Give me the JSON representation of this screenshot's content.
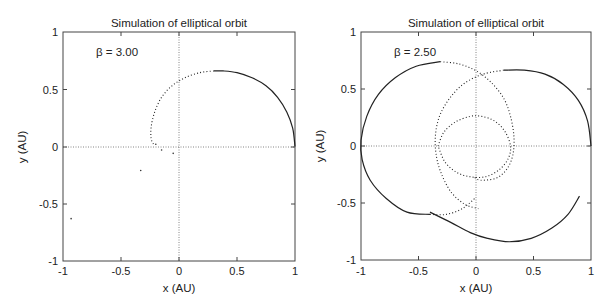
{
  "chart_data": [
    {
      "type": "line",
      "title": "Simulation of elliptical orbit",
      "xlabel": "x (AU)",
      "ylabel": "y (AU)",
      "xlim": [
        -1,
        1
      ],
      "ylim": [
        -1,
        1
      ],
      "xticks": [
        "-1",
        "-0.5",
        "0",
        "0.5",
        "1"
      ],
      "yticks": [
        "1",
        "0.5",
        "0",
        "-0.5",
        "-1"
      ],
      "grid": false,
      "zero_lines": true,
      "annotation": "β = 3.00",
      "series": [
        {
          "name": "orbit-solid",
          "style": "solid",
          "points": [
            [
              1.0,
              0.0
            ],
            [
              0.98,
              0.16
            ],
            [
              0.93,
              0.3
            ],
            [
              0.85,
              0.43
            ],
            [
              0.75,
              0.53
            ],
            [
              0.63,
              0.6
            ],
            [
              0.5,
              0.645
            ],
            [
              0.38,
              0.66
            ],
            [
              0.3,
              0.66
            ]
          ]
        },
        {
          "name": "orbit-dotted",
          "style": "dotted",
          "points": [
            [
              0.3,
              0.66
            ],
            [
              0.18,
              0.645
            ],
            [
              0.05,
              0.6
            ],
            [
              -0.06,
              0.53
            ],
            [
              -0.15,
              0.43
            ],
            [
              -0.21,
              0.3
            ],
            [
              -0.24,
              0.17
            ],
            [
              -0.24,
              0.07
            ],
            [
              -0.22,
              0.02
            ]
          ]
        },
        {
          "name": "scattered-points",
          "style": "points",
          "points": [
            [
              -0.2,
              0.02
            ],
            [
              -0.15,
              -0.03
            ],
            [
              -0.05,
              -0.06
            ],
            [
              -0.33,
              -0.21
            ],
            [
              -0.93,
              -0.63
            ]
          ]
        }
      ]
    },
    {
      "type": "line",
      "title": "Simulation of elliptical orbit",
      "xlabel": "x (AU)",
      "ylabel": "y (AU)",
      "xlim": [
        -1,
        1
      ],
      "ylim": [
        -1,
        1
      ],
      "xticks": [
        "-1",
        "-0.5",
        "0",
        "0.5",
        "1"
      ],
      "yticks": [
        "1",
        "0.5",
        "0",
        "-0.5",
        "-1"
      ],
      "grid": false,
      "zero_lines": true,
      "annotation": "β = 2.50",
      "series": [
        {
          "name": "orbit-1-solid",
          "style": "solid",
          "points": [
            [
              1.0,
              0.0
            ],
            [
              0.97,
              0.22
            ],
            [
              0.89,
              0.4
            ],
            [
              0.76,
              0.54
            ],
            [
              0.6,
              0.63
            ],
            [
              0.42,
              0.665
            ],
            [
              0.24,
              0.665
            ]
          ]
        },
        {
          "name": "orbit-1-dotted",
          "style": "dotted",
          "points": [
            [
              0.24,
              0.665
            ],
            [
              0.06,
              0.63
            ],
            [
              -0.1,
              0.55
            ],
            [
              -0.22,
              0.43
            ],
            [
              -0.31,
              0.28
            ],
            [
              -0.35,
              0.12
            ],
            [
              -0.35,
              -0.05
            ],
            [
              -0.31,
              -0.22
            ],
            [
              -0.22,
              -0.4
            ],
            [
              -0.1,
              -0.51
            ],
            [
              0.02,
              -0.55
            ]
          ]
        },
        {
          "name": "orbit-2-dotted",
          "style": "dotted",
          "points": [
            [
              -0.31,
              0.74
            ],
            [
              -0.15,
              0.72
            ],
            [
              0.0,
              0.66
            ],
            [
              0.13,
              0.56
            ],
            [
              0.24,
              0.42
            ],
            [
              0.3,
              0.26
            ],
            [
              0.33,
              0.08
            ],
            [
              0.32,
              -0.08
            ],
            [
              0.27,
              -0.2
            ],
            [
              0.18,
              -0.28
            ],
            [
              0.04,
              -0.3
            ],
            [
              -0.02,
              -0.27
            ]
          ]
        },
        {
          "name": "orbit-2-solid",
          "style": "solid",
          "points": [
            [
              -0.31,
              0.74
            ],
            [
              -0.52,
              0.7
            ],
            [
              -0.7,
              0.6
            ],
            [
              -0.85,
              0.45
            ],
            [
              -0.95,
              0.26
            ],
            [
              -1.0,
              0.05
            ],
            [
              -0.99,
              -0.12
            ],
            [
              -0.92,
              -0.3
            ],
            [
              -0.78,
              -0.46
            ],
            [
              -0.6,
              -0.58
            ],
            [
              -0.4,
              -0.6
            ]
          ]
        },
        {
          "name": "orbit-3-dotted",
          "style": "dotted",
          "points": [
            [
              -0.4,
              -0.6
            ],
            [
              -0.26,
              -0.6
            ],
            [
              -0.12,
              -0.55
            ],
            [
              0.0,
              -0.45
            ]
          ]
        },
        {
          "name": "orbit-4-solid",
          "style": "solid",
          "points": [
            [
              -0.4,
              -0.58
            ],
            [
              -0.22,
              -0.67
            ],
            [
              -0.05,
              -0.76
            ],
            [
              0.1,
              -0.81
            ],
            [
              0.29,
              -0.84
            ],
            [
              0.48,
              -0.81
            ],
            [
              0.66,
              -0.72
            ],
            [
              0.8,
              -0.6
            ],
            [
              0.9,
              -0.44
            ]
          ]
        },
        {
          "name": "inner-dotted",
          "style": "dotted",
          "points": [
            [
              -0.33,
              0.0
            ],
            [
              -0.28,
              0.12
            ],
            [
              -0.18,
              0.21
            ],
            [
              -0.05,
              0.26
            ],
            [
              0.05,
              0.26
            ],
            [
              0.16,
              0.22
            ],
            [
              0.25,
              0.13
            ],
            [
              0.3,
              0.0
            ],
            [
              0.28,
              -0.11
            ],
            [
              0.2,
              -0.21
            ],
            [
              0.08,
              -0.27
            ],
            [
              -0.05,
              -0.27
            ],
            [
              -0.17,
              -0.23
            ],
            [
              -0.27,
              -0.14
            ],
            [
              -0.33,
              0.0
            ]
          ]
        }
      ]
    }
  ]
}
